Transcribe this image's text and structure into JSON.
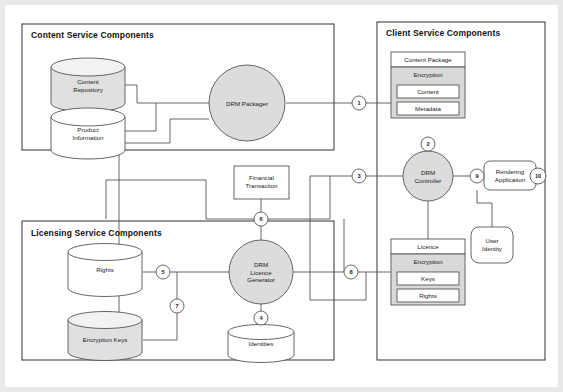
{
  "diagram": {
    "panels": [
      {
        "id": "content-service",
        "label": "Content Service Components"
      },
      {
        "id": "client-service",
        "label": "Client Service Components"
      },
      {
        "id": "licensing-service",
        "label": "Licensing Service Components"
      }
    ],
    "nodes": [
      {
        "id": "content-repository",
        "label": "Content\nRepository",
        "shape": "cylinder",
        "fill": "#e0e0e0"
      },
      {
        "id": "product-information",
        "label": "Product\nInformation",
        "shape": "cylinder",
        "fill": "#ffffff"
      },
      {
        "id": "drm-packager",
        "label": "DRM Packager",
        "shape": "circle",
        "fill": "#dcdcdc"
      },
      {
        "id": "financial-transaction",
        "label": "Financial\nTransaction",
        "shape": "rect",
        "fill": "#ffffff"
      },
      {
        "id": "rights",
        "label": "Rights",
        "shape": "cylinder",
        "fill": "#ffffff"
      },
      {
        "id": "encryption-keys",
        "label": "Encryption Keys",
        "shape": "cylinder",
        "fill": "#e0e0e0"
      },
      {
        "id": "drm-licence-generator",
        "label": "DRM\nLicence\nGenerator",
        "shape": "circle",
        "fill": "#dcdcdc"
      },
      {
        "id": "identities",
        "label": "Identities",
        "shape": "cylinder",
        "fill": "#ffffff"
      },
      {
        "id": "content-package",
        "label": "Content Package",
        "shape": "box",
        "fill": "#ffffff"
      },
      {
        "id": "content-package-encryption",
        "label": "Encryption",
        "shape": "box",
        "fill": "#d9d9d9"
      },
      {
        "id": "content-package-content",
        "label": "Content",
        "shape": "box",
        "fill": "#ffffff"
      },
      {
        "id": "content-package-metadata",
        "label": "Metadata",
        "shape": "box",
        "fill": "#ffffff"
      },
      {
        "id": "drm-controller",
        "label": "DRM\nController",
        "shape": "circle",
        "fill": "#dcdcdc"
      },
      {
        "id": "rendering-application",
        "label": "Rendering\nApplication",
        "shape": "roundrect",
        "fill": "#ffffff"
      },
      {
        "id": "user-identity",
        "label": "User\nIdentity",
        "shape": "roundrect",
        "fill": "#ffffff"
      },
      {
        "id": "licence",
        "label": "Licence",
        "shape": "box",
        "fill": "#ffffff"
      },
      {
        "id": "licence-encryption",
        "label": "Encryption",
        "shape": "box",
        "fill": "#d9d9d9"
      },
      {
        "id": "licence-keys",
        "label": "Keys",
        "shape": "box",
        "fill": "#ffffff"
      },
      {
        "id": "licence-rights",
        "label": "Rights",
        "shape": "box",
        "fill": "#ffffff"
      }
    ],
    "connectors": [
      {
        "id": "c1",
        "label": "1"
      },
      {
        "id": "c2",
        "label": "2"
      },
      {
        "id": "c3",
        "label": "3"
      },
      {
        "id": "c4",
        "label": "4"
      },
      {
        "id": "c5",
        "label": "5"
      },
      {
        "id": "c6",
        "label": "6"
      },
      {
        "id": "c7",
        "label": "7"
      },
      {
        "id": "c8",
        "label": "8"
      },
      {
        "id": "c9",
        "label": "9"
      },
      {
        "id": "c10",
        "label": "10"
      }
    ],
    "colors": {
      "page_background": "#e9e9e9",
      "canvas": "#ffffff",
      "stroke": "#555555",
      "panel_stroke": "#444444",
      "shape_gray": "#dcdcdc",
      "shape_light": "#e0e0e0",
      "encryption_gray": "#d9d9d9",
      "text": "#1a1a1a"
    }
  }
}
